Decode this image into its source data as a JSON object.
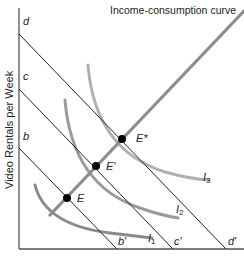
{
  "diagram": {
    "curve_title": "Income-consumption curve",
    "y_axis_label": "Video Rentals per Week",
    "budget_lines": [
      {
        "y_intercept_label": "b",
        "x_intercept_label": "b'"
      },
      {
        "y_intercept_label": "c",
        "x_intercept_label": "c'"
      },
      {
        "y_intercept_label": "d",
        "x_intercept_label": "d'"
      }
    ],
    "equilibria": [
      {
        "label": "E"
      },
      {
        "label": "E'"
      },
      {
        "label": "E*"
      }
    ],
    "indifference_curves": [
      {
        "label": "I",
        "sub": "1",
        "color": "#8a8a8a"
      },
      {
        "label": "I",
        "sub": "2",
        "color": "#9a9a9a"
      },
      {
        "label": "I",
        "sub": "3",
        "color": "#b0b0b0"
      }
    ],
    "colors": {
      "axis": "#555555",
      "budget_line": "#222222",
      "income_consumption": "#8c8c8c",
      "point": "#000000"
    }
  }
}
